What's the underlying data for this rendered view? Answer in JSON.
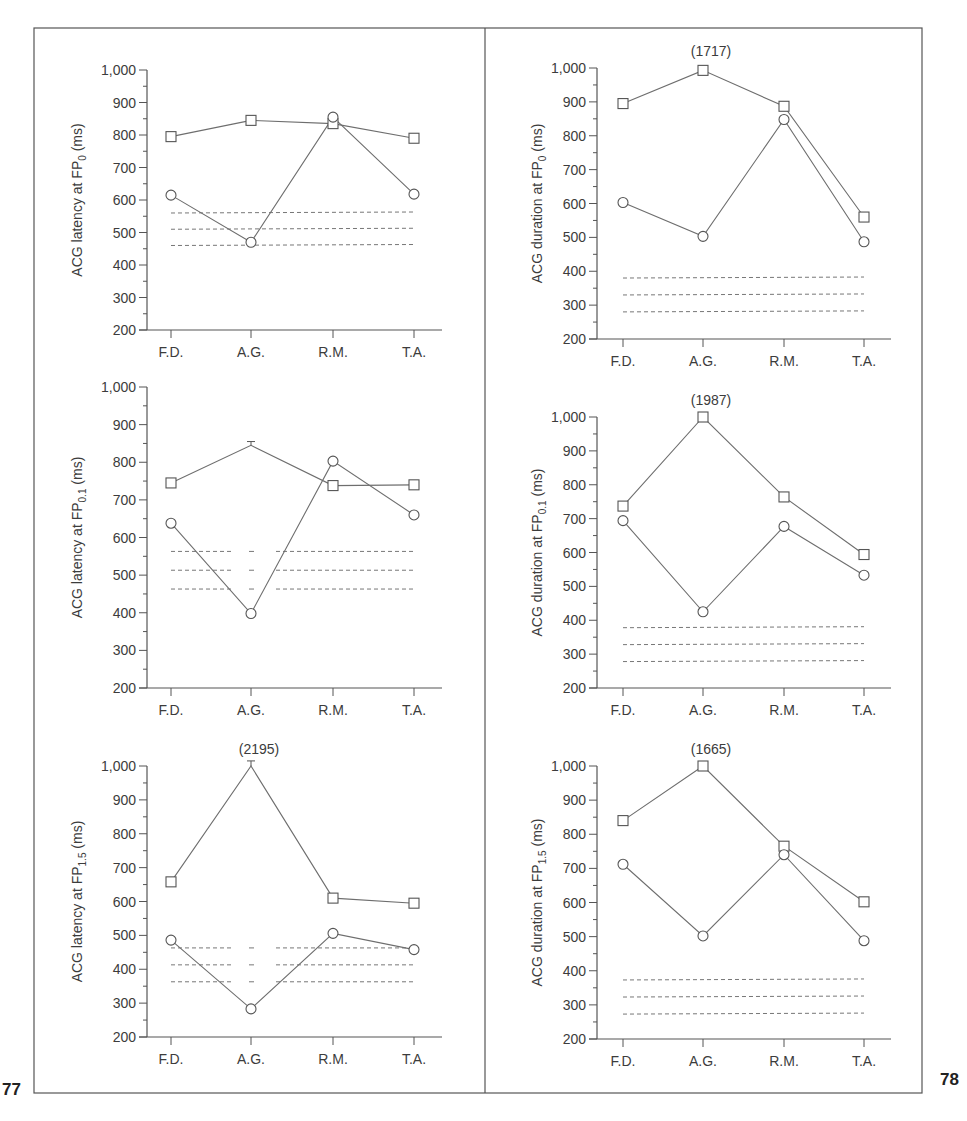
{
  "figure_numbers": {
    "left": "77",
    "right": "78"
  },
  "colors": {
    "line": "#6e6e6e",
    "axis": "#555555",
    "dash": "#777777",
    "text": "#3c3c3c",
    "frame": "#555555"
  },
  "chart_data": [
    {
      "id": "latency-fp0",
      "type": "line",
      "panel": "left-top",
      "ylabel_main": "ACG latency at FP",
      "ylabel_sub": "0",
      "ylabel_unit": " (ms)",
      "categories": [
        "F.D.",
        "A.G.",
        "R.M.",
        "T.A."
      ],
      "yticks": [
        200,
        300,
        400,
        500,
        600,
        700,
        800,
        900,
        1000
      ],
      "ytick_labels": [
        "200",
        "300",
        "400",
        "500",
        "600",
        "700",
        "800",
        "900",
        "1,000"
      ],
      "ylim": [
        200,
        1000
      ],
      "series": [
        {
          "name": "squares",
          "marker": "square",
          "values": [
            795,
            845,
            835,
            790
          ]
        },
        {
          "name": "circles",
          "marker": "circle",
          "values": [
            615,
            470,
            855,
            618
          ]
        }
      ],
      "reference_lines": [
        {
          "value": 560,
          "segments": "full"
        },
        {
          "value": 510,
          "segments": "full"
        },
        {
          "value": 460,
          "segments": "full"
        }
      ],
      "annotations": [],
      "error_bars": []
    },
    {
      "id": "latency-fp01",
      "type": "line",
      "panel": "left-middle",
      "ylabel_main": "ACG latency at FP",
      "ylabel_sub": "0.1",
      "ylabel_unit": " (ms)",
      "categories": [
        "F.D.",
        "A.G.",
        "R.M.",
        "T.A."
      ],
      "yticks": [
        200,
        300,
        400,
        500,
        600,
        700,
        800,
        900,
        1000
      ],
      "ytick_labels": [
        "200",
        "300",
        "400",
        "500",
        "600",
        "700",
        "800",
        "900",
        "1,000"
      ],
      "ylim": [
        200,
        1000
      ],
      "series": [
        {
          "name": "squares",
          "marker": "square",
          "values": [
            745,
            null,
            738,
            740
          ],
          "line_values": [
            745,
            845,
            738,
            740
          ]
        },
        {
          "name": "circles",
          "marker": "circle",
          "values": [
            638,
            398,
            803,
            660
          ]
        }
      ],
      "reference_lines": [
        {
          "value": 563,
          "segments": "broken"
        },
        {
          "value": 513,
          "segments": "broken"
        },
        {
          "value": 463,
          "segments": "broken"
        }
      ],
      "annotations": [],
      "error_bars": [
        {
          "category": "A.G.",
          "value": 845,
          "upper": 855
        }
      ]
    },
    {
      "id": "latency-fp15",
      "type": "line",
      "panel": "left-bottom",
      "ylabel_main": "ACG latency at FP",
      "ylabel_sub": "1.5",
      "ylabel_unit": " (ms)",
      "categories": [
        "F.D.",
        "A.G.",
        "R.M.",
        "T.A."
      ],
      "yticks": [
        200,
        300,
        400,
        500,
        600,
        700,
        800,
        900,
        1000
      ],
      "ytick_labels": [
        "200",
        "300",
        "400",
        "500",
        "600",
        "700",
        "800",
        "900",
        "1,000"
      ],
      "ylim": [
        200,
        1000
      ],
      "series": [
        {
          "name": "squares",
          "marker": "square",
          "values": [
            658,
            null,
            610,
            595
          ],
          "line_values": [
            658,
            1000,
            610,
            595
          ]
        },
        {
          "name": "circles",
          "marker": "circle",
          "values": [
            486,
            283,
            506,
            458
          ]
        }
      ],
      "reference_lines": [
        {
          "value": 463,
          "segments": "broken"
        },
        {
          "value": 413,
          "segments": "broken"
        },
        {
          "value": 363,
          "segments": "broken"
        }
      ],
      "annotations": [
        {
          "category": "A.G.",
          "text": "(2195)"
        }
      ],
      "error_bars": [
        {
          "category": "A.G.",
          "value": 1000,
          "upper": 1015
        }
      ]
    },
    {
      "id": "duration-fp0",
      "type": "line",
      "panel": "right-top",
      "ylabel_main": "ACG duration at FP",
      "ylabel_sub": "0",
      "ylabel_unit": " (ms)",
      "categories": [
        "F.D.",
        "A.G.",
        "R.M.",
        "T.A."
      ],
      "yticks": [
        200,
        300,
        400,
        500,
        600,
        700,
        800,
        900,
        1000
      ],
      "ytick_labels": [
        "200",
        "300",
        "400",
        "500",
        "600",
        "700",
        "800",
        "900",
        "1,000"
      ],
      "ylim": [
        200,
        1000
      ],
      "series": [
        {
          "name": "squares",
          "marker": "square",
          "values": [
            895,
            993,
            887,
            560
          ]
        },
        {
          "name": "circles",
          "marker": "circle",
          "values": [
            603,
            503,
            848,
            487
          ]
        }
      ],
      "reference_lines": [
        {
          "value": 380,
          "segments": "full"
        },
        {
          "value": 330,
          "segments": "full"
        },
        {
          "value": 280,
          "segments": "full"
        }
      ],
      "annotations": [
        {
          "category": "A.G.",
          "text": "(1717)"
        }
      ],
      "error_bars": []
    },
    {
      "id": "duration-fp01",
      "type": "line",
      "panel": "right-middle",
      "ylabel_main": "ACG duration at FP",
      "ylabel_sub": "0.1",
      "ylabel_unit": " (ms)",
      "categories": [
        "F.D.",
        "A.G.",
        "R.M.",
        "T.A."
      ],
      "yticks": [
        200,
        300,
        400,
        500,
        600,
        700,
        800,
        900,
        1000
      ],
      "ytick_labels": [
        "200",
        "300",
        "400",
        "500",
        "600",
        "700",
        "800",
        "900",
        "1,000"
      ],
      "ylim": [
        200,
        1000
      ],
      "series": [
        {
          "name": "squares",
          "marker": "square",
          "values": [
            737,
            1000,
            764,
            594
          ]
        },
        {
          "name": "circles",
          "marker": "circle",
          "values": [
            694,
            425,
            677,
            533
          ]
        }
      ],
      "reference_lines": [
        {
          "value": 378,
          "segments": "full"
        },
        {
          "value": 328,
          "segments": "full"
        },
        {
          "value": 278,
          "segments": "full"
        }
      ],
      "annotations": [
        {
          "category": "A.G.",
          "text": "(1987)"
        }
      ],
      "error_bars": []
    },
    {
      "id": "duration-fp15",
      "type": "line",
      "panel": "right-bottom",
      "ylabel_main": "ACG duration at FP",
      "ylabel_sub": "1.5",
      "ylabel_unit": " (ms)",
      "categories": [
        "F.D.",
        "A.G.",
        "R.M.",
        "T.A."
      ],
      "yticks": [
        200,
        300,
        400,
        500,
        600,
        700,
        800,
        900,
        1000
      ],
      "ytick_labels": [
        "200",
        "300",
        "400",
        "500",
        "600",
        "700",
        "800",
        "900",
        "1,000"
      ],
      "ylim": [
        200,
        1000
      ],
      "series": [
        {
          "name": "squares",
          "marker": "square",
          "values": [
            840,
            1000,
            765,
            602
          ]
        },
        {
          "name": "circles",
          "marker": "circle",
          "values": [
            712,
            502,
            740,
            488
          ]
        }
      ],
      "reference_lines": [
        {
          "value": 373,
          "segments": "full"
        },
        {
          "value": 323,
          "segments": "full"
        },
        {
          "value": 273,
          "segments": "full"
        }
      ],
      "annotations": [
        {
          "category": "A.G.",
          "text": "(1665)"
        }
      ],
      "error_bars": []
    }
  ]
}
